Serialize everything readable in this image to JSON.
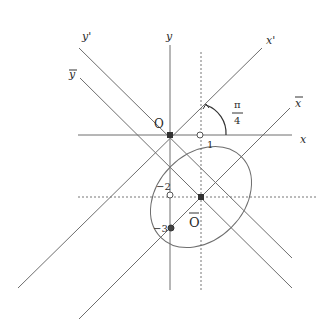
{
  "diagram": {
    "type": "coordinate-rotation-translation",
    "axes": {
      "x": "x",
      "y": "y",
      "x_prime": "x'",
      "y_prime": "y'",
      "x_bar": "x",
      "y_bar": "y"
    },
    "points": {
      "origin": "O",
      "new_origin": "O",
      "tick_x1": "1",
      "tick_y_minus2": "−2",
      "tick_y_minus3": "−3"
    },
    "angle": {
      "numerator": "π",
      "denominator": "4"
    },
    "colors": {
      "line": "#6e6e6e",
      "text": "#2a2a2a",
      "point": "#333333"
    }
  }
}
